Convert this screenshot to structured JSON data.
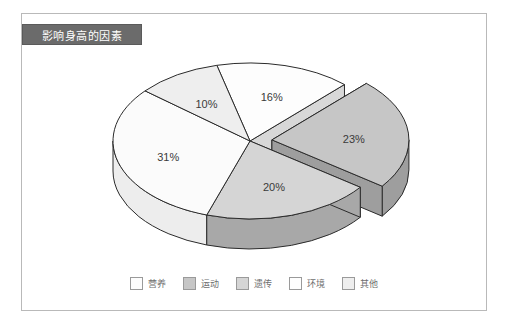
{
  "chart": {
    "title": "影响身高的因素",
    "frame_border_color": "#b9b9b9",
    "title_bar_color": "#6b6b6b",
    "title_text_color": "#ffffff"
  },
  "chart_data": {
    "type": "pie",
    "title": "影响身高的因素",
    "xlabel": "",
    "ylabel": "",
    "three_d": true,
    "exploded_slice": "运动",
    "legend_position": "bottom",
    "grid": false,
    "categories": [
      "营养",
      "运动",
      "遗传",
      "环境",
      "其他"
    ],
    "values": [
      16,
      23,
      20,
      31,
      10
    ],
    "labels": [
      "16%",
      "23%",
      "20%",
      "31%",
      "10%"
    ],
    "slices": [
      {
        "name": "营养",
        "value": 16,
        "label": "16%",
        "color": "#fdfdfd",
        "side_color": "#d8d8d8"
      },
      {
        "name": "运动",
        "value": 23,
        "label": "23%",
        "color": "#c6c6c6",
        "side_color": "#9e9e9e"
      },
      {
        "name": "遗传",
        "value": 20,
        "label": "20%",
        "color": "#d5d5d5",
        "side_color": "#a8a8a8"
      },
      {
        "name": "环境",
        "value": 31,
        "label": "31%",
        "color": "#fbfbfb",
        "side_color": "#ededed"
      },
      {
        "name": "其他",
        "value": 10,
        "label": "10%",
        "color": "#eeeeee",
        "side_color": "#d0d0d0"
      }
    ]
  },
  "legend": {
    "items": [
      {
        "label": "营养",
        "color": "#fdfdfd"
      },
      {
        "label": "运动",
        "color": "#c6c6c6"
      },
      {
        "label": "遗传",
        "color": "#d5d5d5"
      },
      {
        "label": "环境",
        "color": "#fefefe"
      },
      {
        "label": "其他",
        "color": "#eeeeee"
      }
    ]
  }
}
